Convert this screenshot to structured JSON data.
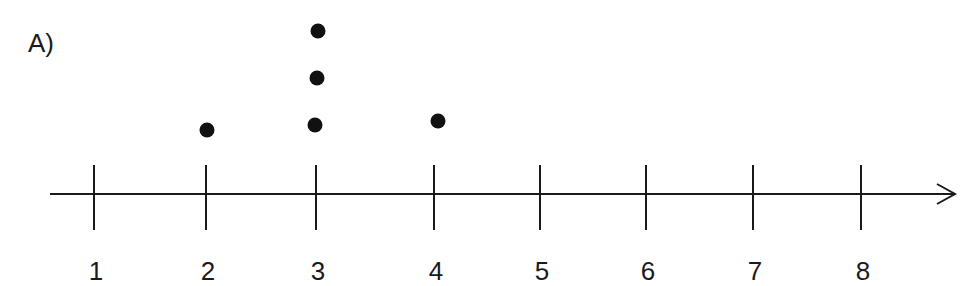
{
  "part_label": "A)",
  "chart_data": {
    "type": "scatter",
    "subtype": "dot_plot",
    "title": "A)",
    "xlabel": "",
    "ylabel": "",
    "x_ticks": [
      1,
      2,
      3,
      4,
      5,
      6,
      7,
      8
    ],
    "xlim": [
      1,
      8
    ],
    "grid": false,
    "legend": null,
    "counts": {
      "1": 0,
      "2": 1,
      "3": 3,
      "4": 1,
      "5": 0,
      "6": 0,
      "7": 0,
      "8": 0
    },
    "values": [
      2,
      3,
      3,
      3,
      4
    ],
    "axis_arrow": "right"
  },
  "layout": {
    "axis_y": 194,
    "axis_x_start": 50,
    "axis_x_end": 955,
    "tick_x": [
      94,
      206,
      316,
      434,
      540,
      646,
      753,
      861
    ],
    "tick_top": 165,
    "tick_bottom": 230,
    "label_y": 280,
    "dots": [
      {
        "x": 207,
        "y": 130
      },
      {
        "x": 315,
        "y": 125
      },
      {
        "x": 317,
        "y": 78
      },
      {
        "x": 318,
        "y": 31
      },
      {
        "x": 438,
        "y": 121
      }
    ],
    "dot_radius": 7.5,
    "color": "#1a1a1a"
  }
}
